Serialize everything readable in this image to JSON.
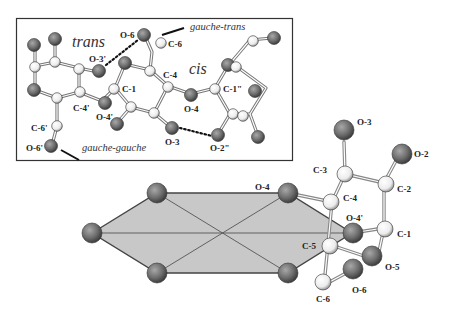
{
  "figure": {
    "inset_box": {
      "x": 16,
      "y": 18,
      "w": 277,
      "h": 143
    },
    "conformation_labels": {
      "trans": "trans",
      "cis": "cis",
      "gauche_trans": "gauche-trans",
      "gauche_gauche": "gauche-gauche"
    },
    "top_atom_labels": {
      "o6": "O-6",
      "c6": "C-6",
      "o3p": "O-3'",
      "c4": "C-4",
      "c1": "C-1",
      "c1pp": "C-1\"",
      "c4p": "C-4'",
      "o4p": "O-4'",
      "o4": "O-4",
      "c6p": "C-6'",
      "o6p": "O-6'",
      "o3": "O-3",
      "o2pp": "O-2\""
    },
    "bottom_atom_labels": {
      "o4": "O-4",
      "o3": "O-3",
      "o2": "O-2",
      "c3": "C-3",
      "c2": "C-2",
      "c4": "C-4",
      "o4p": "O-4'",
      "c1": "C-1",
      "c5": "C-5",
      "o5": "O-5",
      "o6": "O-6",
      "c6": "C-6"
    },
    "colors": {
      "oxygen_atom": "#6e6e6e",
      "carbon_atom": "#f4f4f4",
      "hexagon_fill": "#c8c8c8",
      "bond": "#555555",
      "hbond": "#222222"
    }
  }
}
